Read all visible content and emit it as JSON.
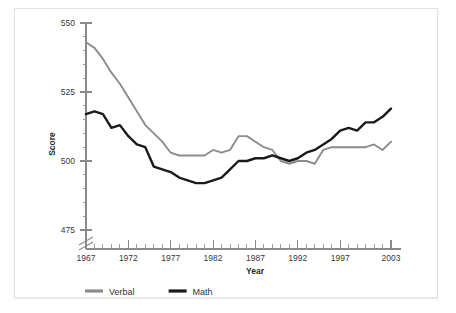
{
  "chart_data": {
    "type": "line",
    "title": "",
    "xlabel": "Year",
    "ylabel": "Score",
    "xlim": [
      1967,
      2003
    ],
    "ylim": [
      475,
      550
    ],
    "y_axis_break": true,
    "y_break_label": "axis-break-below-475",
    "grid": false,
    "legend_position": "bottom-left",
    "y_ticks_major": [
      475,
      500,
      525,
      550
    ],
    "y_ticks_minor": [
      480,
      485,
      490,
      495,
      505,
      510,
      515,
      520,
      530,
      535,
      540,
      545
    ],
    "x_ticks_labeled": [
      1967,
      1972,
      1977,
      1982,
      1987,
      1992,
      1997,
      2003
    ],
    "x": [
      1967,
      1968,
      1969,
      1970,
      1971,
      1972,
      1973,
      1974,
      1975,
      1976,
      1977,
      1978,
      1979,
      1980,
      1981,
      1982,
      1983,
      1984,
      1985,
      1986,
      1987,
      1988,
      1989,
      1990,
      1991,
      1992,
      1993,
      1994,
      1995,
      1996,
      1997,
      1998,
      1999,
      2000,
      2001,
      2002,
      2003
    ],
    "series": [
      {
        "name": "Verbal",
        "color": "#8c8c8c",
        "width": 1.9,
        "values": [
          543,
          541,
          537,
          532,
          528,
          523,
          518,
          513,
          510,
          507,
          503,
          502,
          502,
          502,
          502,
          504,
          503,
          504,
          509,
          509,
          507,
          505,
          504,
          500,
          499,
          500,
          500,
          499,
          504,
          505,
          505,
          505,
          505,
          505,
          506,
          504,
          507
        ]
      },
      {
        "name": "Math",
        "color": "#1a1a1a",
        "width": 2.4,
        "values": [
          517,
          518,
          517,
          512,
          513,
          509,
          506,
          505,
          498,
          497,
          496,
          494,
          493,
          492,
          492,
          493,
          494,
          497,
          500,
          500,
          501,
          501,
          502,
          501,
          500,
          501,
          503,
          504,
          506,
          508,
          511,
          512,
          511,
          514,
          514,
          516,
          519
        ]
      }
    ]
  },
  "legend": {
    "items": [
      {
        "label": "Verbal",
        "color": "#8c8c8c"
      },
      {
        "label": "Math",
        "color": "#1a1a1a"
      }
    ]
  },
  "axes": {
    "y_title": "Score",
    "x_title": "Year"
  }
}
